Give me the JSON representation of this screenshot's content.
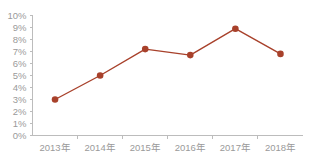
{
  "chart_data": {
    "type": "line",
    "title": "",
    "subtitle": "",
    "xlabel": "",
    "ylabel": "",
    "categories": [
      "2013年",
      "2014年",
      "2015年",
      "2016年",
      "2017年",
      "2018年"
    ],
    "values": [
      3.0,
      5.0,
      7.2,
      6.7,
      8.9,
      6.8
    ],
    "series": [
      {
        "name": "",
        "values": [
          3.0,
          5.0,
          7.2,
          6.7,
          8.9,
          6.8
        ]
      }
    ],
    "ylim": [
      0,
      10
    ],
    "ytick_values": [
      0,
      1,
      2,
      3,
      4,
      5,
      6,
      7,
      8,
      9,
      10
    ],
    "ytick_labels": [
      "0%",
      "1%",
      "2%",
      "3%",
      "4%",
      "5%",
      "6%",
      "7%",
      "8%",
      "9%",
      "10%"
    ],
    "xtick_labels": [
      "2013年",
      "2014年",
      "2015年",
      "2016年",
      "2017年",
      "2018年"
    ],
    "grid": false,
    "legend": false,
    "legend_position": "none",
    "marker": "circle",
    "annotations": []
  },
  "style": {
    "series_color": "#a8412b",
    "axis_color": "#bcbcbc",
    "tick_text_color": "#9a9a9a",
    "background_color": "#ffffff"
  }
}
